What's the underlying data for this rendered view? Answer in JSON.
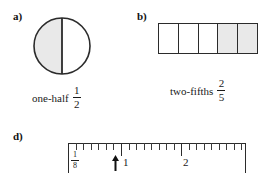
{
  "figure": {
    "background_color": "#ffffff",
    "ink_color": "#1a1a1a",
    "shade_color": "#e9e9e9"
  },
  "parts": {
    "a": {
      "label": "a)",
      "shape": "circle",
      "divisions": 2,
      "shaded": 1,
      "shaded_side": "left",
      "caption_words": "one-half",
      "fraction": {
        "numerator": "1",
        "denominator": "2"
      }
    },
    "b": {
      "label": "b)",
      "shape": "bar",
      "divisions": 5,
      "shaded": 2,
      "cells": [
        {
          "index": 1,
          "shaded": false
        },
        {
          "index": 2,
          "shaded": false
        },
        {
          "index": 3,
          "shaded": false
        },
        {
          "index": 4,
          "shaded": true
        },
        {
          "index": 5,
          "shaded": true
        }
      ],
      "caption_words": "two-fifths",
      "fraction": {
        "numerator": "2",
        "denominator": "5"
      }
    },
    "d": {
      "label": "d)",
      "shape": "ruler",
      "scale_fraction": {
        "numerator": "1",
        "denominator": "8"
      },
      "inch_labels": [
        "1",
        "2"
      ],
      "ticks_per_inch": 8,
      "pointer": {
        "glyph": "arrow-up",
        "position_inches": 0.8
      }
    }
  }
}
